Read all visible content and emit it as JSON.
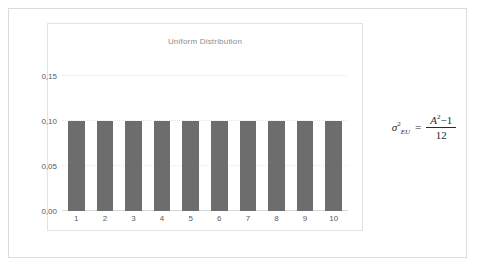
{
  "figure": {
    "border_color": "#dcdcdc",
    "background_color": "#ffffff"
  },
  "chart_data": {
    "type": "bar",
    "title": "Uniform Distribution",
    "xlabel": "",
    "ylabel": "",
    "categories": [
      "1",
      "2",
      "3",
      "4",
      "5",
      "6",
      "7",
      "8",
      "9",
      "10"
    ],
    "values": [
      0.1,
      0.1,
      0.1,
      0.1,
      0.1,
      0.1,
      0.1,
      0.1,
      0.1,
      0.1
    ],
    "ylim": [
      0.0,
      0.175
    ],
    "yticks": [
      0.0,
      0.05,
      0.1,
      0.15
    ],
    "ytick_labels": [
      "0,00",
      "0,05",
      "0,10",
      "0,15"
    ],
    "grid": true,
    "legend": false,
    "bar_color": "#6d6d6d",
    "title_color": "#8d8d8d",
    "tick_label_color": "#5a5a5a",
    "gridline_color": "#e8e8e8",
    "baseline_color": "#d8d8d8"
  },
  "formula": {
    "lhs_symbol": "σ",
    "lhs_superscript": "2",
    "lhs_subscript": "EU",
    "equals": "=",
    "numerator_variable": "A",
    "numerator_superscript": "2",
    "numerator_operator": "−",
    "numerator_constant": "1",
    "denominator": "12"
  }
}
